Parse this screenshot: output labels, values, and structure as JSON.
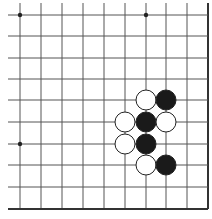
{
  "board": {
    "description": "Go board corner (bottom-right region, 10x10 visible)",
    "cols_x": [
      20,
      41,
      62,
      83,
      104,
      125,
      146,
      166,
      187,
      208
    ],
    "rows_y": [
      15,
      36,
      58,
      79,
      100,
      122,
      144,
      165,
      187,
      209
    ],
    "edges": {
      "right": true,
      "bottom": true,
      "top": false,
      "left": false
    },
    "line_color": "#555555",
    "edge_color": "#333333",
    "star_points": [
      {
        "col": 0,
        "row": 0
      },
      {
        "col": 6,
        "row": 0
      },
      {
        "col": 0,
        "row": 6
      }
    ],
    "stone_radius": 10,
    "stones": [
      {
        "color": "white",
        "col": 6,
        "row": 4
      },
      {
        "color": "black",
        "col": 7,
        "row": 4
      },
      {
        "color": "white",
        "col": 5,
        "row": 5
      },
      {
        "color": "black",
        "col": 6,
        "row": 5
      },
      {
        "color": "white",
        "col": 7,
        "row": 5
      },
      {
        "color": "white",
        "col": 5,
        "row": 6
      },
      {
        "color": "black",
        "col": 6,
        "row": 6
      },
      {
        "color": "white",
        "col": 6,
        "row": 7
      },
      {
        "color": "black",
        "col": 7,
        "row": 7
      }
    ],
    "colors": {
      "black_stone": "#1a1a1a",
      "white_stone": "#ffffff",
      "stone_outline": "#222222"
    }
  }
}
